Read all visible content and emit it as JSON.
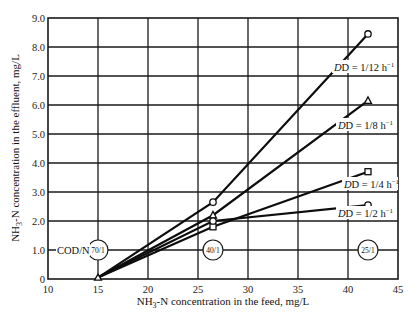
{
  "chart_data": {
    "type": "line",
    "title": "",
    "xlabel": "NH3-N concentration in the feed, mg/L",
    "ylabel": "NH3-N concentration in the effluent, mg/L",
    "xlim": [
      10,
      45
    ],
    "ylim": [
      0,
      9
    ],
    "x_ticks": [
      "10",
      "15",
      "20",
      "25",
      "30",
      "35",
      "40",
      "45"
    ],
    "y_ticks": [
      "0",
      "1.0",
      "2.0",
      "3.0",
      "4.0",
      "5.0",
      "6.0",
      "7.0",
      "8.0",
      "9.0"
    ],
    "grid": true,
    "x": [
      15,
      26.5,
      42
    ],
    "series": [
      {
        "name": "D = 1/12 h⁻¹",
        "marker": "circle",
        "values": [
          0.05,
          2.65,
          8.45
        ]
      },
      {
        "name": "D = 1/8 h⁻¹",
        "marker": "triangle",
        "values": [
          0.05,
          2.2,
          6.15
        ]
      },
      {
        "name": "D = 1/4 h⁻¹",
        "marker": "square",
        "values": [
          0.05,
          1.8,
          3.7
        ]
      },
      {
        "name": "D = 1/2 h⁻¹",
        "marker": "circle",
        "values": [
          0.05,
          2.0,
          2.55
        ]
      }
    ],
    "annotations": [
      {
        "text": "COD/N",
        "x": 11.5,
        "y": 1.0
      },
      {
        "text": "70/1",
        "x": 15,
        "y": 1.0,
        "shape": "circle"
      },
      {
        "text": "40/1",
        "x": 26.5,
        "y": 1.0,
        "shape": "circle"
      },
      {
        "text": "25/1",
        "x": 42,
        "y": 1.0,
        "shape": "circle"
      }
    ]
  },
  "labels": {
    "xlabel_main": "NH",
    "xlabel_sub": "3",
    "xlabel_rest": "-N concentration in the feed, mg/L",
    "ylabel_main": "NH",
    "ylabel_sub": "3",
    "ylabel_rest": "-N concentration in the effluent, mg/L",
    "cod_n": "COD/N",
    "ratio_70": "70/1",
    "ratio_40": "40/1",
    "ratio_25": "25/1",
    "d_12": "D = 1/12 h",
    "d_8": "D = 1/8 h",
    "d_4": "D = 1/4 h",
    "d_2": "D = 1/2 h",
    "exp": "−1"
  }
}
